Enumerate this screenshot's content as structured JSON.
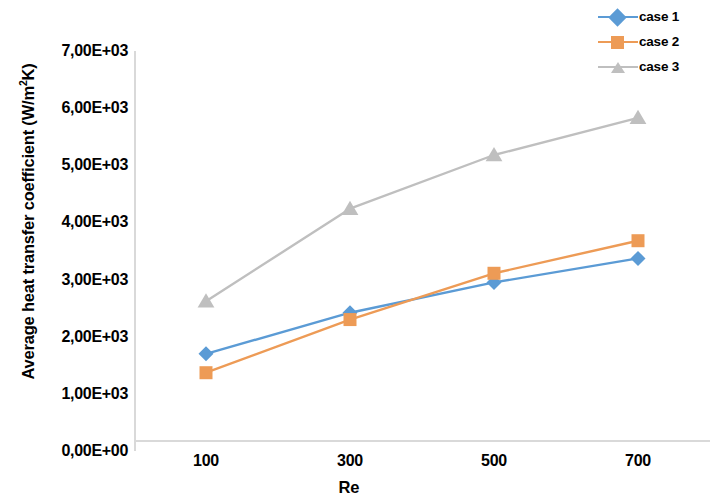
{
  "chart_data": {
    "type": "line",
    "title": "",
    "xlabel": "Re",
    "ylabel": "Average heat transfer coefficient (W/m²K)",
    "categories": [
      "100",
      "300",
      "500",
      "700"
    ],
    "x": [
      100,
      300,
      500,
      700
    ],
    "series": [
      {
        "name": "case 1",
        "color": "#5b9bd5",
        "marker": "diamond",
        "values": [
          1700,
          2420,
          2950,
          3370
        ]
      },
      {
        "name": "case 2",
        "color": "#ed9b56",
        "marker": "square",
        "values": [
          1370,
          2300,
          3110,
          3680
        ]
      },
      {
        "name": "case 3",
        "color": "#bfbfbf",
        "marker": "triangle",
        "values": [
          2620,
          4240,
          5180,
          5830
        ]
      }
    ],
    "ylim": [
      0,
      7000
    ],
    "ytick_values": [
      0,
      1000,
      2000,
      3000,
      4000,
      5000,
      6000,
      7000
    ],
    "ytick_labels": [
      "0,00E+00",
      "1,00E+03",
      "2,00E+03",
      "3,00E+03",
      "4,00E+03",
      "5,00E+03",
      "6,00E+03",
      "7,00E+03"
    ],
    "grid": false,
    "legend_position": "top-right",
    "axis_color": "#d9d9d9"
  },
  "axes": {
    "y_title_main": "Average heat transfer coefficient (W/m",
    "y_title_sup": "2",
    "y_title_tail": "K)",
    "x_title": "Re"
  },
  "legend": {
    "items": [
      {
        "label": "case 1"
      },
      {
        "label": "case 2"
      },
      {
        "label": "case 3"
      }
    ]
  }
}
